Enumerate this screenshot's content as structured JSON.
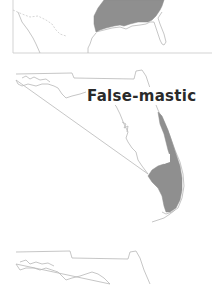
{
  "document": {
    "type": "range-map-figure",
    "species_label": "False-mastic"
  },
  "maps": [
    {
      "id": "top",
      "region": "Southeastern United States (partial)",
      "range_shaded": true,
      "range_color": "#8f8f8f"
    },
    {
      "id": "middle",
      "region": "Florida",
      "label": "False-mastic",
      "range_shaded": true,
      "range_description": "East coast strip and southern tip of Florida",
      "range_color": "#8f8f8f"
    },
    {
      "id": "bottom",
      "region": "Florida (partial)",
      "range_shaded": false
    }
  ],
  "colors": {
    "outline": "#b8b8b8",
    "range_fill": "#8f8f8f",
    "label_text": "#2a2a2a",
    "background": "#ffffff"
  }
}
